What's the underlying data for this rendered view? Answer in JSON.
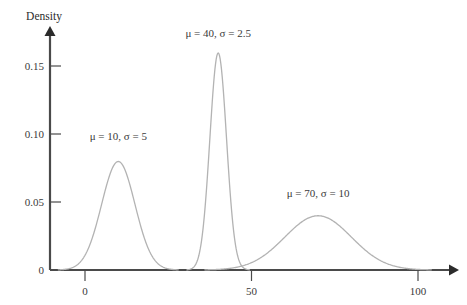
{
  "chart_data": {
    "type": "line",
    "title": "",
    "subtitle": "",
    "xlabel": "",
    "ylabel": "Density",
    "xlim": [
      -10,
      110
    ],
    "ylim": [
      0,
      0.175
    ],
    "grid": false,
    "legend": "none",
    "x_ticks": [
      0,
      50,
      100
    ],
    "x_tick_labels": [
      "0",
      "50",
      "100"
    ],
    "y_ticks": [
      0,
      0.05,
      0.1,
      0.15
    ],
    "y_tick_labels": [
      "0",
      "0.05",
      "0.10",
      "0.15"
    ],
    "curve_color": "#b3b3b3",
    "axis_color": "#4a4a4a",
    "series": [
      {
        "name": "component-1",
        "mu": 10,
        "sigma": 5,
        "peak_density": 0.0798,
        "annotation": "μ = 10, σ = 5",
        "annotation_x": 10,
        "annotation_y": 0.0955
      },
      {
        "name": "component-2",
        "mu": 40,
        "sigma": 2.5,
        "peak_density": 0.1596,
        "annotation": "μ = 40, σ = 2.5",
        "annotation_x": 40,
        "annotation_y": 0.1715
      },
      {
        "name": "component-3",
        "mu": 70,
        "sigma": 10,
        "peak_density": 0.0399,
        "annotation": "μ = 70, σ = 10",
        "annotation_x": 70,
        "annotation_y": 0.0535
      }
    ]
  },
  "axes": {
    "y_axis_label": "Density"
  }
}
